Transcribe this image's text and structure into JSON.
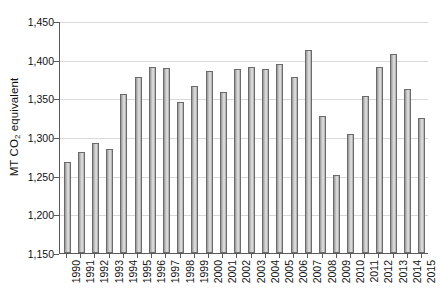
{
  "chart_data": {
    "type": "bar",
    "title": "",
    "subtitle": "",
    "xlabel": "",
    "ylabel": "MT CO2 equivalent",
    "ylabel_prefix": "MT CO",
    "ylabel_sub": "2",
    "ylabel_suffix": " equivalent",
    "ylim": [
      1150,
      1450
    ],
    "ytick_labels": [
      "1,450",
      "1,400",
      "1,350",
      "1,300",
      "1,250",
      "1,200",
      "1,150"
    ],
    "ytick_values": [
      1450,
      1400,
      1350,
      1300,
      1250,
      1200,
      1150
    ],
    "grid": true,
    "grid_axis": "y",
    "legend": "none",
    "bar_fill_color": "#d2d2d2",
    "bar_edge_color": "#6b6b6b",
    "gridline_color": "#d9d9d9",
    "axis_color": "#5a5a5a",
    "categories": [
      "1990",
      "1991",
      "1992",
      "1993",
      "1994",
      "1995",
      "1996",
      "1997",
      "1998",
      "1999",
      "2000",
      "2001",
      "2002",
      "2003",
      "2004",
      "2005",
      "2006",
      "2007",
      "2008",
      "2009",
      "2010",
      "2011",
      "2012",
      "2013",
      "2014",
      "2015"
    ],
    "values": [
      1268,
      1280,
      1292,
      1285,
      1355,
      1378,
      1390,
      1389,
      1345,
      1366,
      1386,
      1358,
      1388,
      1390,
      1388,
      1395,
      1377,
      1412,
      1327,
      1251,
      1304,
      1353,
      1390,
      1407,
      1362,
      1324
    ]
  }
}
